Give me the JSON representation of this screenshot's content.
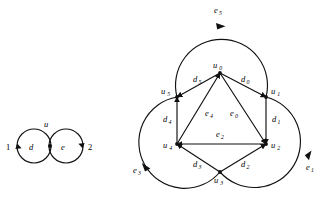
{
  "figure": {
    "background_color": "#ffffff",
    "ink_color": "#111111"
  },
  "left_diagram": {
    "name": "bouquet-of-two-loops",
    "vertices": [
      {
        "id": "u",
        "label": "u",
        "x": 48,
        "y": 129
      }
    ],
    "loops": [
      {
        "id": "d",
        "label": "d",
        "cx": 34,
        "cy": 146,
        "r": 17,
        "arrow_at": "left",
        "endpoint_label": "1"
      },
      {
        "id": "e",
        "label": "e",
        "cx": 66,
        "cy": 146,
        "r": 17,
        "arrow_at": "right",
        "endpoint_label": "2"
      }
    ],
    "outer_labels": [
      {
        "text": "1",
        "x": 9,
        "y": 149
      },
      {
        "text": "2",
        "x": 88,
        "y": 149
      }
    ],
    "edge_labels": [
      {
        "text": "d",
        "x": 31,
        "y": 150
      },
      {
        "text": "e",
        "x": 63,
        "y": 150
      }
    ],
    "vertex_label": {
      "text": "u",
      "x": 46,
      "y": 125
    }
  },
  "right_diagram": {
    "name": "hexagon-with-three-outer-circles",
    "vertices": [
      {
        "id": "u0",
        "base": "u",
        "sub": "0",
        "x": 220,
        "y": 73,
        "label_x": 214,
        "label_y": 68
      },
      {
        "id": "u1",
        "base": "u",
        "sub": "1",
        "x": 266,
        "y": 97,
        "label_x": 271,
        "label_y": 94
      },
      {
        "id": "u2",
        "base": "u",
        "sub": "2",
        "x": 266,
        "y": 144,
        "label_x": 271,
        "label_y": 148
      },
      {
        "id": "u3",
        "base": "u",
        "sub": "3",
        "x": 220,
        "y": 172,
        "label_x": 215,
        "label_y": 182
      },
      {
        "id": "u4",
        "base": "u",
        "sub": "4",
        "x": 177,
        "y": 144,
        "label_x": 165,
        "label_y": 148
      },
      {
        "id": "u5",
        "base": "u",
        "sub": "5",
        "x": 177,
        "y": 97,
        "label_x": 163,
        "label_y": 94
      }
    ],
    "straight_edges": [
      {
        "id": "d0",
        "base": "d",
        "sub": "0",
        "from": "u0",
        "to": "u1",
        "label_x": 243,
        "label_y": 82,
        "direction": "u0 to u1"
      },
      {
        "id": "d1",
        "base": "d",
        "sub": "1",
        "from": "u1",
        "to": "u2",
        "label_x": 272,
        "label_y": 122,
        "direction": "u1 to u2"
      },
      {
        "id": "d2",
        "base": "d",
        "sub": "2",
        "from": "u3",
        "to": "u2",
        "label_x": 243,
        "label_y": 166,
        "direction": "u3 to u2"
      },
      {
        "id": "d3",
        "base": "d",
        "sub": "3",
        "from": "u3",
        "to": "u4",
        "label_x": 196,
        "label_y": 166,
        "direction": "u3 to u4"
      },
      {
        "id": "d4",
        "base": "d",
        "sub": "4",
        "from": "u4",
        "to": "u5",
        "label_x": 165,
        "label_y": 122,
        "direction": "u4 to u5"
      },
      {
        "id": "d5",
        "base": "d",
        "sub": "5",
        "from": "u0",
        "to": "u5",
        "label_x": 196,
        "label_y": 82,
        "direction": "u0 to u5"
      },
      {
        "id": "e0",
        "base": "e",
        "sub": "0",
        "from": "u0",
        "to": "u2",
        "label_x": 231,
        "label_y": 115,
        "direction": "u0 to u2"
      },
      {
        "id": "e2",
        "base": "e",
        "sub": "2",
        "from": "u2",
        "to": "u4",
        "label_x": 218,
        "label_y": 136,
        "direction": "u2 to u4"
      },
      {
        "id": "e4",
        "base": "e",
        "sub": "4",
        "from": "u4",
        "to": "u0",
        "label_x": 207,
        "label_y": 115,
        "direction": "u4 to u0"
      }
    ],
    "arc_edges": [
      {
        "id": "e5",
        "base": "e",
        "sub": "5",
        "from": "u5",
        "to": "u1",
        "label_x": 216,
        "label_y": 12,
        "position": "top",
        "arrow_at_top": true
      },
      {
        "id": "e1",
        "base": "e",
        "sub": "1",
        "from": "u1",
        "to": "u3",
        "label_x": 306,
        "label_y": 170,
        "position": "lower-right",
        "arrow_at_top": false
      },
      {
        "id": "e3",
        "base": "e",
        "sub": "3",
        "from": "u3",
        "to": "u5",
        "label_x": 136,
        "label_y": 172,
        "position": "lower-left",
        "arrow_at_top": false
      }
    ]
  }
}
